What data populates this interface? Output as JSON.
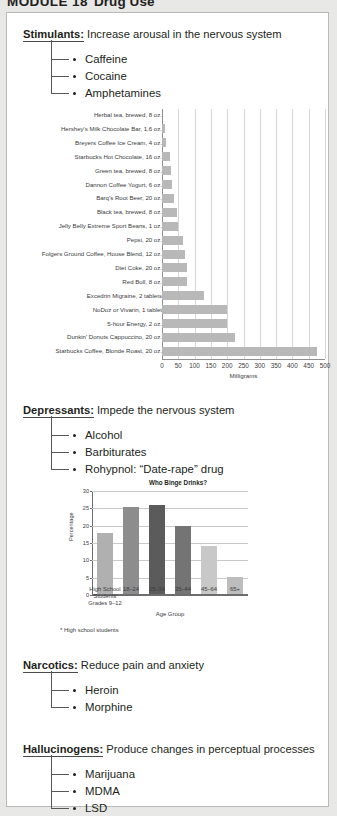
{
  "module": {
    "number": "MODULE 18",
    "title": "Drug Use"
  },
  "categories": [
    {
      "name": "Stimulants:",
      "description": "Increase arousal in the nervous system",
      "items": [
        "Caffeine",
        "Cocaine",
        "Amphetamines"
      ]
    },
    {
      "name": "Depressants:",
      "description": "Impede the nervous system",
      "items": [
        "Alcohol",
        "Barbiturates",
        "Rohypnol: “Date-rape” drug"
      ]
    },
    {
      "name": "Narcotics:",
      "description": "Reduce pain and anxiety",
      "items": [
        "Heroin",
        "Morphine"
      ]
    },
    {
      "name": "Hallucinogens:",
      "description": "Produce changes in perceptual processes",
      "items": [
        "Marijuana",
        "MDMA",
        "LSD"
      ]
    }
  ],
  "chart_data": [
    {
      "type": "bar",
      "orientation": "horizontal",
      "title": "",
      "xlabel": "Milligrams",
      "ylabel": "",
      "xlim": [
        0,
        500
      ],
      "xticks": [
        0,
        50,
        100,
        150,
        200,
        250,
        300,
        350,
        400,
        450,
        500
      ],
      "grid": true,
      "bar_color": "#b8b8b8",
      "categories": [
        "Herbal tea, brewed, 8 oz.",
        "Hershey's Milk Chocolate Bar, 1.6 oz.",
        "Breyers Coffee Ice Cream, 4 oz.",
        "Starbucks Hot Chocolate, 16 oz.",
        "Green tea, brewed, 8 oz.",
        "Dannon Coffee Yogurt, 6 oz.",
        "Barq's Root Beer, 20 oz.",
        "Black tea, brewed, 8 oz.",
        "Jelly Belly Extreme Sport Beans, 1 oz.",
        "Pepsi, 20 oz.",
        "Folgers Ground Coffee, House Blend, 12 oz.",
        "Diet Coke, 20 oz.",
        "Red Bull, 8 oz.",
        "Excedrin Migraine, 2 tablets",
        "NoDoz or Vivarin, 1 tablet",
        "5-hour Energy, 2 oz.",
        "Dunkin' Donuts Cappuccino, 20 oz.",
        "Starbucks Coffee, Blonde Roast, 20 oz."
      ],
      "values": [
        0,
        9,
        11,
        25,
        29,
        30,
        38,
        47,
        50,
        63,
        72,
        76,
        77,
        130,
        200,
        200,
        225,
        475
      ]
    },
    {
      "type": "bar",
      "orientation": "vertical",
      "title": "Who Binge Drinks?",
      "xlabel": "Age Group",
      "ylabel": "Percentage",
      "ylim": [
        0,
        30
      ],
      "yticks": [
        0,
        5,
        10,
        15,
        20,
        25,
        30
      ],
      "grid": true,
      "footnote": "* High school students",
      "categories": [
        "High School Students Grades 9–12",
        "18–24",
        "25–34",
        "35–44",
        "45–64",
        "65+"
      ],
      "category_lines": [
        [
          "High School",
          "Students",
          "Grades 9–12"
        ],
        [
          "18–24"
        ],
        [
          "25–34"
        ],
        [
          "35–44"
        ],
        [
          "45–64"
        ],
        [
          "65+"
        ]
      ],
      "values": [
        17.6,
        25.2,
        25.8,
        19.6,
        13.8,
        4.9
      ],
      "bar_colors": [
        "#b0b0b0",
        "#8d8d8d",
        "#5b5b5b",
        "#747474",
        "#c8c8c8",
        "#bdbdbd"
      ]
    }
  ]
}
